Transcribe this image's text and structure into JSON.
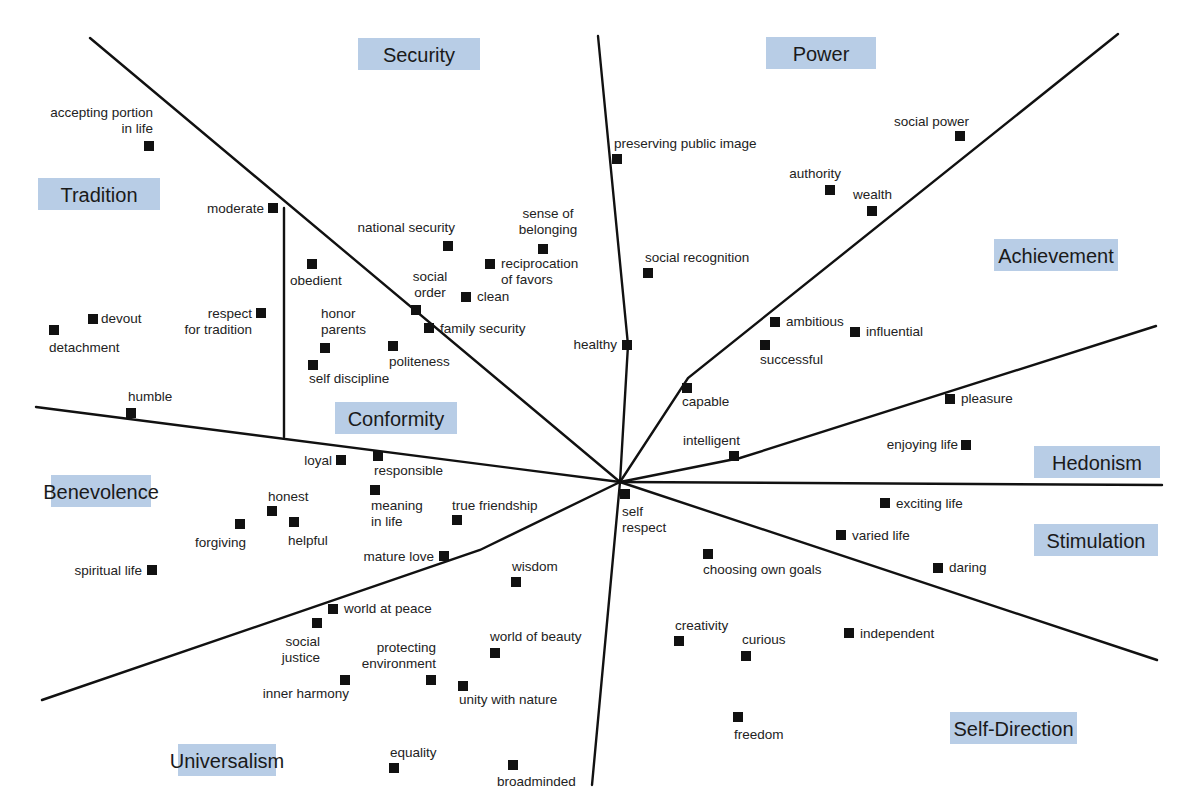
{
  "chart_data": {
    "type": "diagram",
    "center": [
      620,
      482
    ],
    "regions": [
      {
        "name": "Security",
        "box": [
          358,
          38,
          122,
          32
        ]
      },
      {
        "name": "Power",
        "box": [
          766,
          37,
          110,
          32
        ]
      },
      {
        "name": "Tradition",
        "box": [
          38,
          178,
          122,
          32
        ]
      },
      {
        "name": "Achievement",
        "box": [
          994,
          239,
          124,
          32
        ]
      },
      {
        "name": "Conformity",
        "box": [
          335,
          402,
          122,
          32
        ]
      },
      {
        "name": "Hedonism",
        "box": [
          1034,
          446,
          126,
          32
        ]
      },
      {
        "name": "Benevolence",
        "box": [
          51,
          475,
          100,
          32
        ]
      },
      {
        "name": "Stimulation",
        "box": [
          1034,
          524,
          124,
          32
        ]
      },
      {
        "name": "Self-Direction",
        "box": [
          950,
          712,
          127,
          32
        ]
      },
      {
        "name": "Universalism",
        "box": [
          178,
          744,
          98,
          32
        ]
      }
    ],
    "dividers": [
      {
        "points": [
          [
            90,
            38
          ],
          [
            620,
            482
          ]
        ]
      },
      {
        "points": [
          [
            598,
            36
          ],
          [
            628,
            345
          ],
          [
            620,
            482
          ]
        ]
      },
      {
        "points": [
          [
            1118,
            34
          ],
          [
            688,
            378
          ],
          [
            620,
            482
          ]
        ]
      },
      {
        "points": [
          [
            1156,
            326
          ],
          [
            740,
            458
          ],
          [
            620,
            482
          ]
        ]
      },
      {
        "points": [
          [
            1162,
            485
          ],
          [
            620,
            482
          ]
        ]
      },
      {
        "points": [
          [
            1157,
            660
          ],
          [
            620,
            482
          ]
        ]
      },
      {
        "points": [
          [
            620,
            482
          ],
          [
            592,
            785
          ]
        ]
      },
      {
        "points": [
          [
            620,
            482
          ],
          [
            480,
            550
          ],
          [
            42,
            700
          ]
        ]
      },
      {
        "points": [
          [
            36,
            407
          ],
          [
            620,
            482
          ]
        ]
      },
      {
        "points": [
          [
            284,
            208
          ],
          [
            284,
            437
          ]
        ]
      }
    ],
    "items": [
      {
        "label": [
          "accepting portion",
          "in life"
        ],
        "x": 149,
        "y": 146,
        "lx": 153,
        "ly": 117,
        "anchor": "end"
      },
      {
        "label": [
          "moderate"
        ],
        "x": 273,
        "y": 208,
        "lx": 264,
        "ly": 213,
        "anchor": "end"
      },
      {
        "label": [
          "obedient"
        ],
        "x": 312,
        "y": 264,
        "lx": 290,
        "ly": 285,
        "anchor": "start"
      },
      {
        "label": [
          "devout"
        ],
        "x": 93,
        "y": 319,
        "lx": 101,
        "ly": 323,
        "anchor": "start"
      },
      {
        "label": [
          "detachment"
        ],
        "x": 54,
        "y": 330,
        "lx": 49,
        "ly": 352,
        "anchor": "start"
      },
      {
        "label": [
          "respect",
          "for tradition"
        ],
        "x": 261,
        "y": 313,
        "lx": 252,
        "ly": 318,
        "anchor": "end"
      },
      {
        "label": [
          "honor",
          "parents"
        ],
        "x": 325,
        "y": 348,
        "lx": 321,
        "ly": 318,
        "anchor": "start"
      },
      {
        "label": [
          "self discipline"
        ],
        "x": 313,
        "y": 365,
        "lx": 309,
        "ly": 383,
        "anchor": "start"
      },
      {
        "label": [
          "politeness"
        ],
        "x": 393,
        "y": 346,
        "lx": 389,
        "ly": 366,
        "anchor": "start"
      },
      {
        "label": [
          "humble"
        ],
        "x": 131,
        "y": 413,
        "lx": 128,
        "ly": 401,
        "anchor": "start"
      },
      {
        "label": [
          "national security"
        ],
        "x": 448,
        "y": 246,
        "lx": 455,
        "ly": 232,
        "anchor": "end"
      },
      {
        "label": [
          "sense of",
          "belonging"
        ],
        "x": 543,
        "y": 249,
        "lx": 548,
        "ly": 218,
        "anchor": "middle"
      },
      {
        "label": [
          "reciprocation",
          "of favors"
        ],
        "x": 490,
        "y": 264,
        "lx": 501,
        "ly": 268,
        "anchor": "start"
      },
      {
        "label": [
          "social",
          "order"
        ],
        "x": 416,
        "y": 310,
        "lx": 430,
        "ly": 281,
        "anchor": "middle"
      },
      {
        "label": [
          "clean"
        ],
        "x": 466,
        "y": 297,
        "lx": 477,
        "ly": 301,
        "anchor": "start"
      },
      {
        "label": [
          "family security"
        ],
        "x": 429,
        "y": 328,
        "lx": 440,
        "ly": 333,
        "anchor": "start"
      },
      {
        "label": [
          "preserving public image"
        ],
        "x": 617,
        "y": 159,
        "lx": 614,
        "ly": 148,
        "anchor": "start"
      },
      {
        "label": [
          "social recognition"
        ],
        "x": 648,
        "y": 273,
        "lx": 645,
        "ly": 262,
        "anchor": "start"
      },
      {
        "label": [
          "healthy"
        ],
        "x": 627,
        "y": 345,
        "lx": 617,
        "ly": 349,
        "anchor": "end"
      },
      {
        "label": [
          "authority"
        ],
        "x": 830,
        "y": 190,
        "lx": 841,
        "ly": 178,
        "anchor": "end"
      },
      {
        "label": [
          "wealth"
        ],
        "x": 872,
        "y": 211,
        "lx": 853,
        "ly": 199,
        "anchor": "start"
      },
      {
        "label": [
          "social power"
        ],
        "x": 960,
        "y": 136,
        "lx": 969,
        "ly": 126,
        "anchor": "end"
      },
      {
        "label": [
          "ambitious"
        ],
        "x": 775,
        "y": 322,
        "lx": 786,
        "ly": 326,
        "anchor": "start"
      },
      {
        "label": [
          "influential"
        ],
        "x": 855,
        "y": 332,
        "lx": 866,
        "ly": 336,
        "anchor": "start"
      },
      {
        "label": [
          "successful"
        ],
        "x": 765,
        "y": 345,
        "lx": 760,
        "ly": 364,
        "anchor": "start"
      },
      {
        "label": [
          "capable"
        ],
        "x": 687,
        "y": 388,
        "lx": 682,
        "ly": 406,
        "anchor": "start"
      },
      {
        "label": [
          "intelligent"
        ],
        "x": 734,
        "y": 456,
        "lx": 740,
        "ly": 445,
        "anchor": "end"
      },
      {
        "label": [
          "pleasure"
        ],
        "x": 950,
        "y": 399,
        "lx": 961,
        "ly": 403,
        "anchor": "start"
      },
      {
        "label": [
          "enjoying life"
        ],
        "x": 966,
        "y": 445,
        "lx": 958,
        "ly": 449,
        "anchor": "end"
      },
      {
        "label": [
          "loyal"
        ],
        "x": 341,
        "y": 460,
        "lx": 332,
        "ly": 465,
        "anchor": "end"
      },
      {
        "label": [
          "responsible"
        ],
        "x": 378,
        "y": 456,
        "lx": 374,
        "ly": 475,
        "anchor": "start"
      },
      {
        "label": [
          "meaning",
          "in life"
        ],
        "x": 375,
        "y": 490,
        "lx": 371,
        "ly": 510,
        "anchor": "start"
      },
      {
        "label": [
          "true friendship"
        ],
        "x": 457,
        "y": 520,
        "lx": 452,
        "ly": 510,
        "anchor": "start"
      },
      {
        "label": [
          "honest"
        ],
        "x": 272,
        "y": 511,
        "lx": 268,
        "ly": 501,
        "anchor": "start"
      },
      {
        "label": [
          "forgiving"
        ],
        "x": 240,
        "y": 524,
        "lx": 246,
        "ly": 547,
        "anchor": "end"
      },
      {
        "label": [
          "helpful"
        ],
        "x": 294,
        "y": 522,
        "lx": 288,
        "ly": 545,
        "anchor": "start"
      },
      {
        "label": [
          "mature love"
        ],
        "x": 444,
        "y": 556,
        "lx": 434,
        "ly": 561,
        "anchor": "end"
      },
      {
        "label": [
          "spiritual life"
        ],
        "x": 152,
        "y": 570,
        "lx": 142,
        "ly": 575,
        "anchor": "end"
      },
      {
        "label": [
          "self",
          "respect"
        ],
        "x": 625,
        "y": 494,
        "lx": 622,
        "ly": 516,
        "anchor": "start"
      },
      {
        "label": [
          "exciting life"
        ],
        "x": 885,
        "y": 503,
        "lx": 896,
        "ly": 508,
        "anchor": "start"
      },
      {
        "label": [
          "varied life"
        ],
        "x": 841,
        "y": 535,
        "lx": 852,
        "ly": 540,
        "anchor": "start"
      },
      {
        "label": [
          "daring"
        ],
        "x": 938,
        "y": 568,
        "lx": 949,
        "ly": 572,
        "anchor": "start"
      },
      {
        "label": [
          "choosing own goals"
        ],
        "x": 708,
        "y": 554,
        "lx": 703,
        "ly": 574,
        "anchor": "start"
      },
      {
        "label": [
          "wisdom"
        ],
        "x": 516,
        "y": 582,
        "lx": 512,
        "ly": 571,
        "anchor": "start"
      },
      {
        "label": [
          "world at peace"
        ],
        "x": 333,
        "y": 609,
        "lx": 344,
        "ly": 613,
        "anchor": "start"
      },
      {
        "label": [
          "social",
          "justice"
        ],
        "x": 317,
        "y": 623,
        "lx": 320,
        "ly": 646,
        "anchor": "end"
      },
      {
        "label": [
          "world of beauty"
        ],
        "x": 495,
        "y": 653,
        "lx": 490,
        "ly": 641,
        "anchor": "start"
      },
      {
        "label": [
          "protecting",
          "environment"
        ],
        "x": 431,
        "y": 680,
        "lx": 436,
        "ly": 652,
        "anchor": "end"
      },
      {
        "label": [
          "inner harmony"
        ],
        "x": 345,
        "y": 680,
        "lx": 349,
        "ly": 698,
        "anchor": "end"
      },
      {
        "label": [
          "unity with nature"
        ],
        "x": 463,
        "y": 686,
        "lx": 459,
        "ly": 704,
        "anchor": "start"
      },
      {
        "label": [
          "creativity"
        ],
        "x": 679,
        "y": 641,
        "lx": 675,
        "ly": 630,
        "anchor": "start"
      },
      {
        "label": [
          "curious"
        ],
        "x": 746,
        "y": 656,
        "lx": 742,
        "ly": 644,
        "anchor": "start"
      },
      {
        "label": [
          "independent"
        ],
        "x": 849,
        "y": 633,
        "lx": 860,
        "ly": 638,
        "anchor": "start"
      },
      {
        "label": [
          "freedom"
        ],
        "x": 738,
        "y": 717,
        "lx": 734,
        "ly": 739,
        "anchor": "start"
      },
      {
        "label": [
          "equality"
        ],
        "x": 394,
        "y": 768,
        "lx": 390,
        "ly": 757,
        "anchor": "start"
      },
      {
        "label": [
          "broadminded"
        ],
        "x": 513,
        "y": 765,
        "lx": 497,
        "ly": 786,
        "anchor": "start"
      }
    ],
    "colors": {
      "region_box": "#b8cde6",
      "line": "#111111",
      "marker": "#111111",
      "text": "#222222"
    }
  }
}
